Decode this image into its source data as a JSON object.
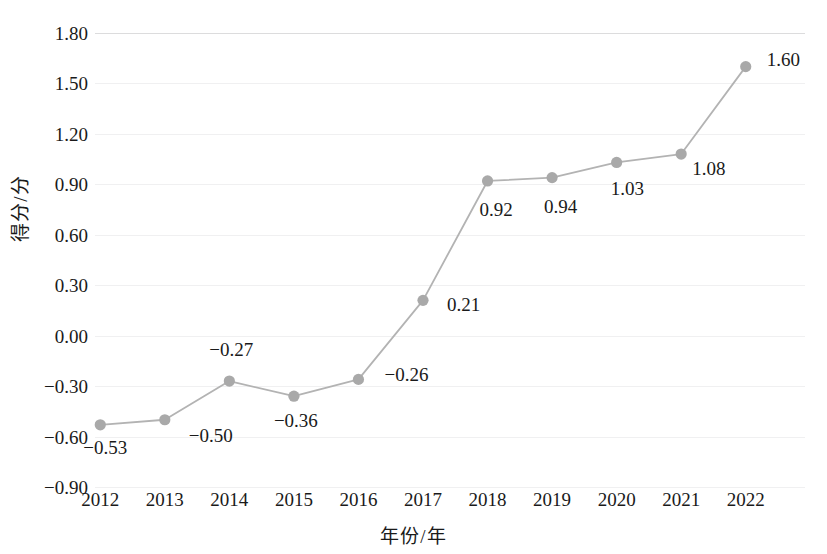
{
  "chart_data": {
    "type": "line",
    "title": "",
    "xlabel": "年份/年",
    "ylabel": "得分/分",
    "categories": [
      "2012",
      "2013",
      "2014",
      "2015",
      "2016",
      "2017",
      "2018",
      "2019",
      "2020",
      "2021",
      "2022"
    ],
    "values": [
      -0.53,
      -0.5,
      -0.27,
      -0.36,
      -0.26,
      0.21,
      0.92,
      0.94,
      1.03,
      1.08,
      1.6
    ],
    "point_labels": [
      "−0.53",
      "−0.50",
      "−0.27",
      "−0.36",
      "−0.26",
      "0.21",
      "0.92",
      "0.94",
      "1.03",
      "1.08",
      "1.60"
    ],
    "ylim": [
      -0.9,
      1.8
    ],
    "ytick_values": [
      1.8,
      1.5,
      1.2,
      0.9,
      0.6,
      0.3,
      0.0,
      -0.3,
      -0.6,
      -0.9
    ],
    "ytick_labels": [
      "1.80",
      "1.50",
      "1.20",
      "0.90",
      "0.60",
      "0.30",
      "0.00",
      "−0.30",
      "−0.60",
      "−0.90"
    ],
    "ytick_step": 0.3,
    "grid": true,
    "legend": "none",
    "series_color": "#b3b3b3",
    "marker_color": "#a9a9a9",
    "grid_color": "#f0f0f1",
    "text_color": "#1a1a1a"
  }
}
